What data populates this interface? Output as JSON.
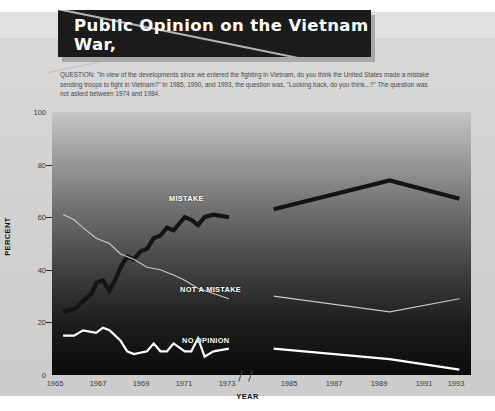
{
  "title": "Public Opinion on the Vietnam War,\n1965–1993",
  "question": "QUESTION: \"In view of the developments since we entered the fighting in Vietnam, do you think the United States made a mistake sending troops to fight in Vietnam?\" In 1985, 1990, and 1993, the question was, \"Looking back, do you think...?\" The question was not asked between 1974 and 1984.",
  "axis": {
    "ylabel": "PERCENT",
    "xlabel": "YEAR",
    "yticks": [
      "100",
      "80",
      "60",
      "40",
      "20",
      "0"
    ],
    "xticks": [
      "1965",
      "1967",
      "1969",
      "1971",
      "1973",
      "1985",
      "1987",
      "1989",
      "1991",
      "1993"
    ]
  },
  "series_labels": {
    "mistake": "MISTAKE",
    "not_a_mistake": "NOT A MISTAKE",
    "no_opinion": "NO OPINION"
  },
  "colors": {
    "mistake": "#141414",
    "not_a_mistake": "#c9c9c9",
    "no_opinion": "#ffffff",
    "title_bg": "#1b1b1b",
    "page_bg": "#d4d4d4"
  },
  "chart_data": {
    "type": "line",
    "title": "Public Opinion on the Vietnam War, 1965–1993",
    "xlabel": "YEAR",
    "ylabel": "PERCENT",
    "ylim": [
      0,
      100
    ],
    "xlim_left": [
      1965,
      1973.5
    ],
    "xlim_right": [
      1984.5,
      1993.5
    ],
    "grid": false,
    "legend": "inline-labels",
    "axis_break": "1974–1984 (question not asked)",
    "series": [
      {
        "name": "MISTAKE",
        "color": "#141414",
        "x": [
          1965.5,
          1966.0,
          1966.4,
          1966.8,
          1967.0,
          1967.3,
          1967.6,
          1967.9,
          1968.1,
          1968.4,
          1968.7,
          1969.0,
          1969.3,
          1969.6,
          1969.9,
          1970.2,
          1970.5,
          1970.8,
          1971.0,
          1971.3,
          1971.6,
          1971.9,
          1972.3,
          1973.0,
          1985,
          1990,
          1993
        ],
        "y": [
          24,
          25,
          28,
          31,
          35,
          36,
          32,
          37,
          41,
          45,
          44,
          47,
          48,
          52,
          53,
          56,
          55,
          58,
          60,
          59,
          57,
          60,
          61,
          60,
          63,
          74,
          67
        ]
      },
      {
        "name": "NOT A MISTAKE",
        "color": "#c9c9c9",
        "x": [
          1965.5,
          1966.0,
          1966.4,
          1967.0,
          1967.6,
          1968.1,
          1968.7,
          1969.3,
          1969.9,
          1970.5,
          1971.0,
          1971.6,
          1972.3,
          1973.0,
          1985,
          1990,
          1993
        ],
        "y": [
          61,
          59,
          56,
          52,
          50,
          46,
          44,
          41,
          40,
          38,
          36,
          33,
          31,
          29,
          30,
          24,
          29
        ]
      },
      {
        "name": "NO OPINION",
        "color": "#ffffff",
        "x": [
          1965.5,
          1966.0,
          1966.4,
          1967.0,
          1967.3,
          1967.6,
          1968.1,
          1968.4,
          1968.7,
          1969.3,
          1969.6,
          1969.9,
          1970.2,
          1970.5,
          1971.0,
          1971.3,
          1971.6,
          1971.9,
          1972.3,
          1973.0,
          1985,
          1990,
          1993
        ],
        "y": [
          15,
          15,
          17,
          16,
          18,
          17,
          13,
          9,
          8,
          9,
          12,
          9,
          9,
          12,
          9,
          9,
          14,
          7,
          9,
          10,
          10,
          6,
          2
        ]
      }
    ]
  }
}
